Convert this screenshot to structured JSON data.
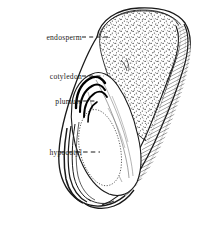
{
  "figure": {
    "background_color": "#ffffff",
    "ink_color": "#1a1a1a",
    "width": 207,
    "height": 226
  },
  "labels": [
    {
      "id": "endosperm",
      "text": "endosperm",
      "leader_style": "dashed",
      "leader_from_x": 82,
      "leader_to_x": 110,
      "leader_y": 37
    },
    {
      "id": "cotyledon",
      "text": "cotyledon",
      "leader_style": "dashed",
      "leader_from_x": 82,
      "leader_to_x": 104,
      "leader_y": 76
    },
    {
      "id": "plumule",
      "text": "plumule",
      "leader_style": "dashed",
      "leader_from_x": 76,
      "leader_to_x": 96,
      "leader_y": 101
    },
    {
      "id": "hypocotyl",
      "text": "hypocotyl",
      "leader_style": "dashed",
      "leader_from_x": 60,
      "leader_to_x": 100,
      "leader_y": 152
    }
  ],
  "structures": [
    {
      "id": "seed-coat",
      "name": "seed coat outline"
    },
    {
      "id": "endosperm-region",
      "name": "endosperm stippled region"
    },
    {
      "id": "cotyledon-region",
      "name": "cotyledon body"
    },
    {
      "id": "plumule-region",
      "name": "plumule nested arcs"
    },
    {
      "id": "hypocotyl-region",
      "name": "hypocotyl axis"
    }
  ]
}
